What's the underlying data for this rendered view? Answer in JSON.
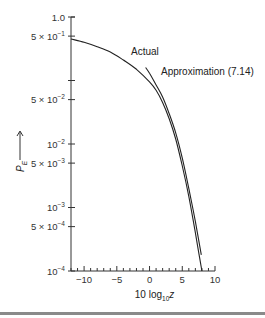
{
  "chart_data": {
    "type": "line",
    "title": "",
    "xlabel": "10 log10 z",
    "xlabel_parts": {
      "main": "10 log",
      "sub": "10",
      "var": "z"
    },
    "ylabel": "P_E",
    "ylabel_parts": {
      "main": "P",
      "sub": "E",
      "arrow": "⟶"
    },
    "x_scale": "linear",
    "y_scale": "log",
    "xlim": [
      -12,
      10
    ],
    "ylim": [
      0.0001,
      1.0
    ],
    "grid": false,
    "x_ticks": [
      -10,
      -5,
      0,
      5,
      10
    ],
    "x_tick_labels": [
      "−10",
      "−5",
      "0",
      "5",
      "10"
    ],
    "x_minor_step": 1,
    "y_ticks": [
      {
        "value": 1.0,
        "label": "1.0",
        "mant": "1.0",
        "exp": ""
      },
      {
        "value": 0.5,
        "label": "5 × 10^-1",
        "mant": "5 × 10",
        "exp": "−1"
      },
      {
        "value": 0.1,
        "label": "",
        "mant": "",
        "exp": ""
      },
      {
        "value": 0.05,
        "label": "5 × 10^-2",
        "mant": "5 × 10",
        "exp": "−2"
      },
      {
        "value": 0.01,
        "label": "10^-2",
        "mant": "10",
        "exp": "−2"
      },
      {
        "value": 0.005,
        "label": "5 × 10^-3",
        "mant": "5 × 10",
        "exp": "−3"
      },
      {
        "value": 0.001,
        "label": "10^-3",
        "mant": "10",
        "exp": "−3"
      },
      {
        "value": 0.0005,
        "label": "5 × 10^-4",
        "mant": "5 × 10",
        "exp": "−4"
      },
      {
        "value": 0.0001,
        "label": "10^-4",
        "mant": "10",
        "exp": "−4"
      }
    ],
    "series": [
      {
        "name": "Actual",
        "x": [
          -12,
          -10,
          -8,
          -6,
          -4,
          -2,
          0,
          1,
          2,
          3,
          4,
          5,
          6,
          7,
          7.5,
          8
        ],
        "y": [
          0.45,
          0.4,
          0.34,
          0.28,
          0.21,
          0.15,
          0.095,
          0.07,
          0.045,
          0.025,
          0.012,
          0.0045,
          0.0015,
          0.0004,
          0.0002,
          0.0001
        ]
      },
      {
        "name": "Approximation (7.14)",
        "x": [
          -0.6,
          0,
          1,
          2,
          3,
          4,
          5,
          6,
          7,
          7.9
        ],
        "y": [
          0.16,
          0.13,
          0.085,
          0.055,
          0.03,
          0.015,
          0.006,
          0.002,
          0.0006,
          0.00018
        ]
      }
    ],
    "annotations": [
      {
        "text": "Actual",
        "x": -3.2,
        "y": 0.24
      },
      {
        "text": "Approximation (7.14)",
        "x": 1.0,
        "y": 0.095
      }
    ],
    "legend": "inline-labels"
  }
}
